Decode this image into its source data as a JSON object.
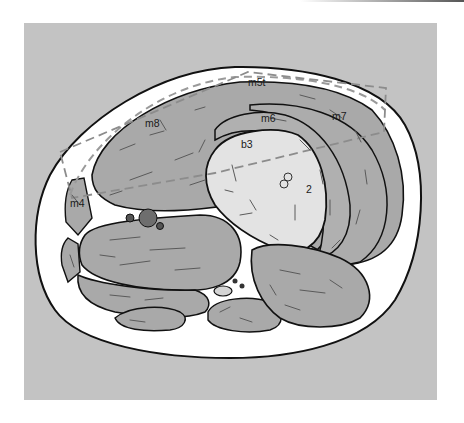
{
  "figure": {
    "type": "anatomical cross-section diagram",
    "colors": {
      "background_panel": "#c3c3c3",
      "skin_band": "#ffffff",
      "muscle_fill": "#a9a9a9",
      "bone_fill": "#e3e3e3",
      "outline": "#111111",
      "dashed_box": "#8c8c8c",
      "vessel_fill": "#6e6e6e"
    },
    "labels": {
      "m5t": "m5t",
      "m6": "m6",
      "m7": "m7",
      "m8": "m8",
      "b3": "b3",
      "m4": "m4"
    },
    "annotations": {
      "bone_mark": "2"
    }
  }
}
